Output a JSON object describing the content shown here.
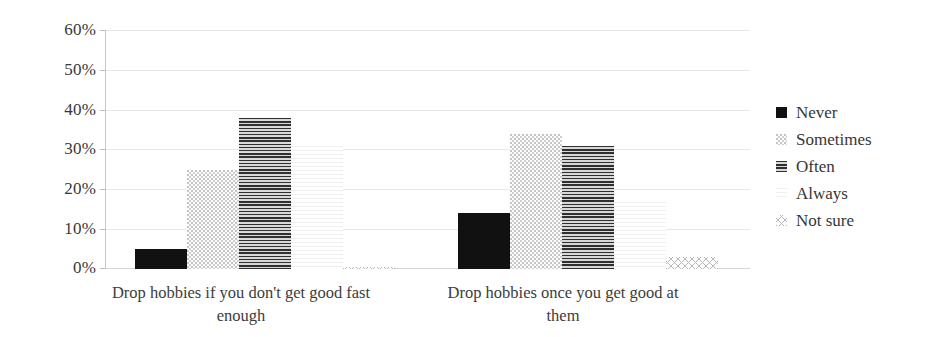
{
  "chart_data": {
    "type": "bar",
    "title": "",
    "subtitle": "",
    "xlabel": "",
    "ylabel": "",
    "grid": true,
    "legend_position": "right",
    "ylim": [
      0,
      60
    ],
    "ytick_labels": [
      "60%",
      "50%",
      "40%",
      "30%",
      "20%",
      "10%",
      "0%"
    ],
    "ytick_values": [
      60,
      50,
      40,
      30,
      20,
      10,
      0
    ],
    "categories": [
      "Drop hobbies if you don't get good fast enough",
      "Drop hobbies once you get good at them"
    ],
    "series": [
      {
        "name": "Never",
        "values": [
          5,
          14
        ],
        "fill": "solid-black",
        "color": "#111111"
      },
      {
        "name": "Sometimes",
        "values": [
          25,
          34
        ],
        "fill": "light-dots",
        "color": "#d0d0d0"
      },
      {
        "name": "Often",
        "values": [
          38,
          31
        ],
        "fill": "horizontal-lines",
        "color": "#6f6f6f"
      },
      {
        "name": "Always",
        "values": [
          31,
          17
        ],
        "fill": "very-light-grid",
        "color": "#f2f2f2"
      },
      {
        "name": "Not sure",
        "values": [
          0.5,
          3
        ],
        "fill": "cross-hatch",
        "color": "#bdbdbd"
      }
    ]
  },
  "legend": {
    "items": [
      {
        "label": "Never"
      },
      {
        "label": "Sometimes"
      },
      {
        "label": "Often"
      },
      {
        "label": "Always"
      },
      {
        "label": "Not sure"
      }
    ]
  }
}
